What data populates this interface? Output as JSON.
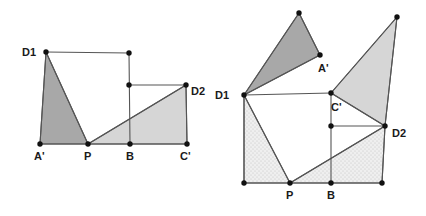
{
  "figure": {
    "background_color": "#ffffff",
    "stroke_color": "#555555",
    "vertex_color": "#111111",
    "label_color": "#1a1a1a",
    "fill_dark": "#a8a8a8",
    "fill_light": "#d6d6d6",
    "fill_pale": "#e8e8e8",
    "fill_white": "#ffffff"
  },
  "diagrams": [
    {
      "id": "left-diagram",
      "name": "left-figure",
      "points": {
        "D1": {
          "x": 46,
          "y": 52,
          "label": "D1",
          "label_x": 22,
          "label_y": 56
        },
        "T1": {
          "x": 129,
          "y": 53,
          "label": "",
          "label_x": 0,
          "label_y": 0
        },
        "M1": {
          "x": 129,
          "y": 85,
          "label": "",
          "label_x": 0,
          "label_y": 0
        },
        "D2": {
          "x": 186,
          "y": 85,
          "label": "D2",
          "label_x": 191,
          "label_y": 95
        },
        "Aq": {
          "x": 40,
          "y": 144,
          "label": "A'",
          "label_x": 34,
          "label_y": 160
        },
        "P": {
          "x": 88,
          "y": 144,
          "label": "P",
          "label_x": 84,
          "label_y": 160
        },
        "B": {
          "x": 130,
          "y": 144,
          "label": "B",
          "label_x": 126,
          "label_y": 160
        },
        "Cq": {
          "x": 187,
          "y": 144,
          "label": "C'",
          "label_x": 180,
          "label_y": 160
        }
      },
      "shapes": [
        {
          "name": "left-dark-triangle",
          "fill": "dark",
          "pts": "D1,Aq,P"
        },
        {
          "name": "left-light-triangle",
          "fill": "light",
          "pts": "P,Cq,D2"
        }
      ],
      "segments": [
        {
          "name": "seg-D1-T1",
          "pts": "D1,T1"
        },
        {
          "name": "seg-T1-B",
          "pts": "T1,B"
        },
        {
          "name": "seg-M1-D2",
          "pts": "M1,D2"
        },
        {
          "name": "seg-D2-Cq",
          "pts": "D2,Cq"
        },
        {
          "name": "seg-Aq-Cq",
          "pts": "Aq,Cq"
        },
        {
          "name": "seg-D1-Aq",
          "pts": "D1,Aq"
        },
        {
          "name": "seg-D1-P",
          "pts": "D1,P"
        },
        {
          "name": "seg-P-D2",
          "pts": "P,D2"
        }
      ]
    },
    {
      "id": "right-diagram",
      "name": "right-figure",
      "points": {
        "K": {
          "x": 299,
          "y": 13,
          "label": "",
          "label_x": 0,
          "label_y": 0
        },
        "R": {
          "x": 397,
          "y": 17,
          "label": "",
          "label_x": 0,
          "label_y": 0
        },
        "Aq": {
          "x": 320,
          "y": 55,
          "label": "A'",
          "label_x": 318,
          "label_y": 72
        },
        "D1": {
          "x": 244,
          "y": 95,
          "label": "D1",
          "label_x": 215,
          "label_y": 99
        },
        "Cq": {
          "x": 331,
          "y": 93,
          "label": "C'",
          "label_x": 331,
          "label_y": 111
        },
        "M2": {
          "x": 331,
          "y": 126,
          "label": "",
          "label_x": 0,
          "label_y": 0
        },
        "D2": {
          "x": 385,
          "y": 126,
          "label": "D2",
          "label_x": 392,
          "label_y": 137
        },
        "L": {
          "x": 244,
          "y": 183,
          "label": "",
          "label_x": 0,
          "label_y": 0
        },
        "P": {
          "x": 290,
          "y": 183,
          "label": "P",
          "label_x": 286,
          "label_y": 199
        },
        "B": {
          "x": 331,
          "y": 183,
          "label": "B",
          "label_x": 327,
          "label_y": 199
        },
        "E": {
          "x": 382,
          "y": 183,
          "label": "",
          "label_x": 0,
          "label_y": 0
        }
      },
      "shapes": [
        {
          "name": "right-dark-triangle",
          "fill": "dark",
          "pts": "D1,K,Aq"
        },
        {
          "name": "right-upper-triangle",
          "fill": "light",
          "pts": "Cq,R,D2"
        },
        {
          "name": "right-left-region",
          "fill": "pale",
          "pts": "D1,L,P"
        },
        {
          "name": "right-lower-region",
          "fill": "pale",
          "pts": "P,B,E,D2"
        }
      ],
      "segments": [
        {
          "name": "seg-D1-Cq",
          "pts": "D1,Cq"
        },
        {
          "name": "seg-Cq-M2",
          "pts": "Cq,M2"
        },
        {
          "name": "seg-M2-D2",
          "pts": "M2,D2"
        },
        {
          "name": "seg-D1-L",
          "pts": "D1,L"
        },
        {
          "name": "seg-L-E",
          "pts": "L,E"
        },
        {
          "name": "seg-E-D2",
          "pts": "E,D2"
        },
        {
          "name": "seg-D1-P",
          "pts": "D1,P"
        },
        {
          "name": "seg-P-D2",
          "pts": "P,D2"
        },
        {
          "name": "seg-B-M2",
          "pts": "B,M2"
        },
        {
          "name": "seg-D1-K",
          "pts": "D1,K"
        },
        {
          "name": "seg-K-Aq",
          "pts": "K,Aq"
        },
        {
          "name": "seg-Aq-D1",
          "pts": "Aq,D1"
        },
        {
          "name": "seg-Cq-R",
          "pts": "Cq,R"
        },
        {
          "name": "seg-R-D2",
          "pts": "R,D2"
        },
        {
          "name": "seg-D2-Cq2",
          "pts": "D2,Cq"
        }
      ]
    }
  ]
}
